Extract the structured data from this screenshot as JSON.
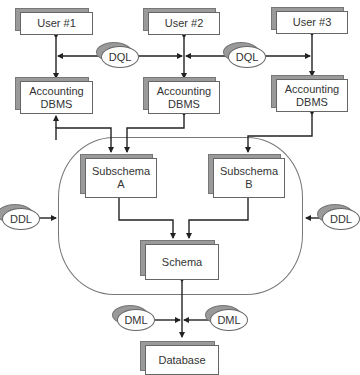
{
  "diagram": {
    "users": [
      {
        "label": "User #1"
      },
      {
        "label": "User #2"
      },
      {
        "label": "User #3"
      }
    ],
    "dbms": [
      {
        "label": "Accounting\nDBMS"
      },
      {
        "label": "Accounting\nDBMS"
      },
      {
        "label": "Accounting\nDBMS"
      }
    ],
    "subschemas": [
      {
        "label": "Subschema\nA"
      },
      {
        "label": "Subschema\nB"
      }
    ],
    "schema": {
      "label": "Schema"
    },
    "database": {
      "label": "Database"
    },
    "languages": {
      "dql_left": "DQL",
      "dql_right": "DQL",
      "ddl_left": "DDL",
      "ddl_right": "DDL",
      "dml_left": "DML",
      "dml_right": "DML"
    },
    "colors": {
      "line": "#222222",
      "box_border": "#666666",
      "shadow": "#9a9a9a",
      "boundary": "#777777"
    }
  }
}
